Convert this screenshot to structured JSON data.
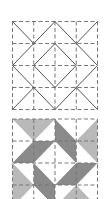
{
  "figure": {
    "colors": {
      "background": "#ffffff",
      "line": "#555555",
      "dashed_grid": "#777777",
      "light_gray": "#b9b9b9",
      "dark_gray": "#8a8a8a"
    },
    "grid_size": 4
  },
  "top_diagram": {
    "label": "line layout",
    "solid_lines": [
      [
        [
          0,
          0
        ],
        [
          1,
          1
        ]
      ],
      [
        [
          4,
          0
        ],
        [
          3,
          1
        ]
      ],
      [
        [
          0,
          4
        ],
        [
          1,
          3
        ]
      ],
      [
        [
          4,
          4
        ],
        [
          3,
          3
        ]
      ],
      [
        [
          2,
          0
        ],
        [
          4,
          2
        ]
      ],
      [
        [
          4,
          2
        ],
        [
          2,
          4
        ]
      ],
      [
        [
          2,
          4
        ],
        [
          0,
          2
        ]
      ],
      [
        [
          0,
          2
        ],
        [
          2,
          0
        ]
      ],
      [
        [
          2,
          1
        ],
        [
          3,
          2
        ]
      ],
      [
        [
          3,
          2
        ],
        [
          2,
          3
        ]
      ],
      [
        [
          2,
          3
        ],
        [
          1,
          2
        ]
      ],
      [
        [
          1,
          2
        ],
        [
          2,
          1
        ]
      ]
    ]
  },
  "bottom_block": {
    "label": "shaded block",
    "light_triangles": [
      [
        [
          0,
          0
        ],
        [
          2,
          0
        ],
        [
          1,
          1
        ]
      ],
      [
        [
          4,
          0
        ],
        [
          4,
          2
        ],
        [
          3,
          1
        ]
      ],
      [
        [
          0,
          2
        ],
        [
          0,
          4
        ],
        [
          1,
          3
        ]
      ],
      [
        [
          2,
          4
        ],
        [
          4,
          4
        ],
        [
          3,
          3
        ]
      ]
    ],
    "dark_parallelograms": [
      [
        [
          2,
          0
        ],
        [
          3,
          1
        ],
        [
          3,
          2
        ],
        [
          2,
          1
        ]
      ],
      [
        [
          3,
          2
        ],
        [
          4,
          2
        ],
        [
          3,
          3
        ],
        [
          2,
          3
        ]
      ],
      [
        [
          1,
          2
        ],
        [
          2,
          3
        ],
        [
          2,
          4
        ],
        [
          1,
          3
        ]
      ],
      [
        [
          1,
          1
        ],
        [
          2,
          1
        ],
        [
          1,
          2
        ],
        [
          0,
          2
        ]
      ]
    ]
  }
}
